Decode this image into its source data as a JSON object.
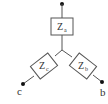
{
  "diagram": {
    "type": "wye-impedance-network",
    "impedances": [
      {
        "id": "a",
        "symbol": "Z",
        "subscript": "a"
      },
      {
        "id": "b",
        "symbol": "Z",
        "subscript": "b"
      },
      {
        "id": "c",
        "symbol": "Z",
        "subscript": "c"
      }
    ],
    "terminals": [
      {
        "id": "a",
        "label": ""
      },
      {
        "id": "b",
        "label": "b"
      },
      {
        "id": "c",
        "label": "c"
      }
    ],
    "colors": {
      "line": "#555555",
      "node": "#111111",
      "text": "#333333"
    }
  }
}
